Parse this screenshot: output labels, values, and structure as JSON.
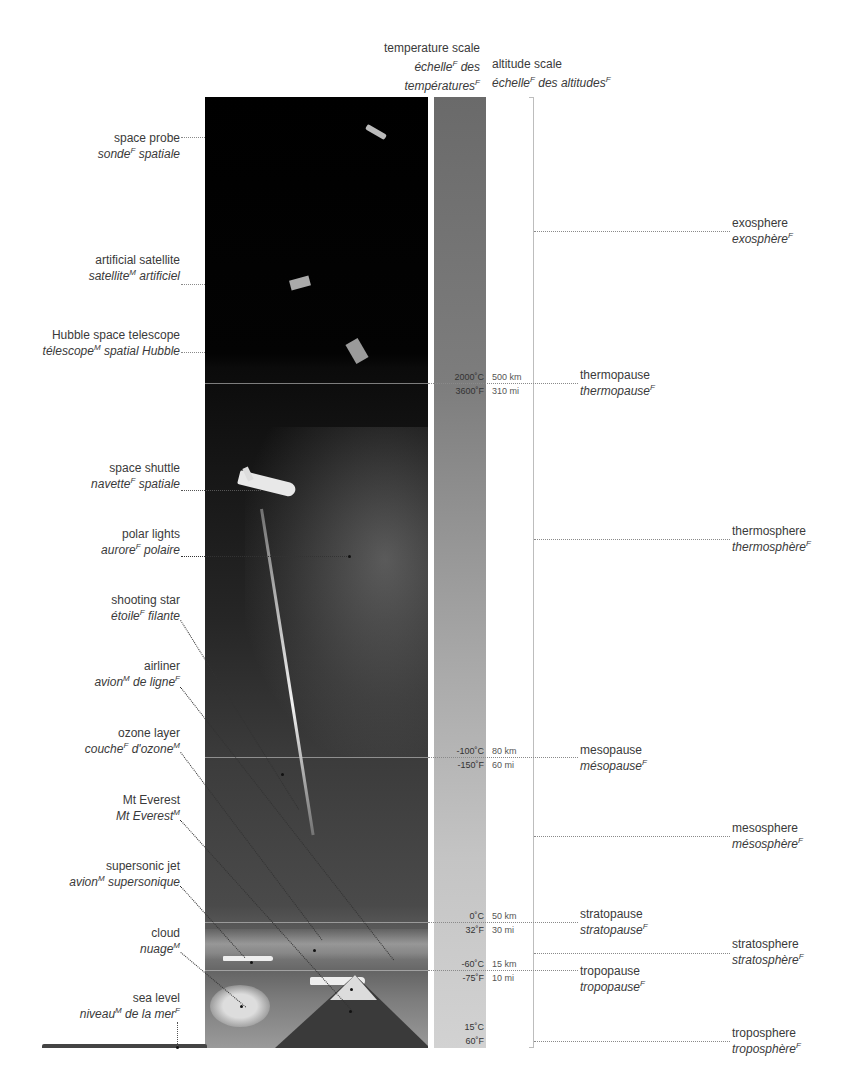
{
  "headers": {
    "temperature_scale": {
      "en": "temperature scale",
      "fr1": "échelle",
      "fr1_g": "F",
      "fr2": " des",
      "fr3": "températures",
      "fr3_g": "F"
    },
    "altitude_scale": {
      "en": "altitude scale",
      "fr1": "échelle",
      "fr1_g": "F",
      "fr2": " des altitudes",
      "fr2_g": "F"
    }
  },
  "left_labels": [
    {
      "en": "space probe",
      "fr": "sonde",
      "g": "F",
      "fr_rest": " spatiale"
    },
    {
      "en": "artificial satellite",
      "fr": "satellite",
      "g": "M",
      "fr_rest": " artificiel"
    },
    {
      "en": "Hubble space telescope",
      "fr": "télescope",
      "g": "M",
      "fr_rest": " spatial Hubble"
    },
    {
      "en": "space shuttle",
      "fr": "navette",
      "g": "F",
      "fr_rest": " spatiale"
    },
    {
      "en": "polar lights",
      "fr": "aurore",
      "g": "F",
      "fr_rest": " polaire"
    },
    {
      "en": "shooting star",
      "fr": "étoile",
      "g": "F",
      "fr_rest": " filante"
    },
    {
      "en": "airliner",
      "fr": "avion",
      "g": "M",
      "fr_rest": " de ligne",
      "g2": "F"
    },
    {
      "en": "ozone layer",
      "fr": "couche",
      "g": "F",
      "fr_rest": " d'ozone",
      "g2": "M"
    },
    {
      "en": "Mt Everest",
      "fr": "Mt Everest",
      "g": "M",
      "fr_rest": ""
    },
    {
      "en": "supersonic jet",
      "fr": "avion",
      "g": "M",
      "fr_rest": " supersonique"
    },
    {
      "en": "cloud",
      "fr": "nuage",
      "g": "M",
      "fr_rest": ""
    },
    {
      "en": "sea level",
      "fr": "niveau",
      "g": "M",
      "fr_rest": " de la mer",
      "g2": "F"
    }
  ],
  "boundaries": [
    {
      "en": "thermopause",
      "fr": "thermopause",
      "g": "F",
      "temp_c": "2000˚C",
      "temp_f": "3600˚F",
      "alt_km": "500 km",
      "alt_mi": "310 mi"
    },
    {
      "en": "mesopause",
      "fr": "mésopause",
      "g": "F",
      "temp_c": "-100˚C",
      "temp_f": "-150˚F",
      "alt_km": "80 km",
      "alt_mi": "60 mi"
    },
    {
      "en": "stratopause",
      "fr": "stratopause",
      "g": "F",
      "temp_c": "0˚C",
      "temp_f": "32˚F",
      "alt_km": "50 km",
      "alt_mi": "30 mi"
    },
    {
      "en": "tropopause",
      "fr": "tropopause",
      "g": "F",
      "temp_c": "-60˚C",
      "temp_f": "-75˚F",
      "alt_km": "15 km",
      "alt_mi": "10 mi"
    }
  ],
  "surface_temp": {
    "temp_c": "15˚C",
    "temp_f": "60˚F"
  },
  "layers": [
    {
      "en": "exosphere",
      "fr": "exosphère",
      "g": "F"
    },
    {
      "en": "thermosphere",
      "fr": "thermosphère",
      "g": "F"
    },
    {
      "en": "mesosphere",
      "fr": "mésosphère",
      "g": "F"
    },
    {
      "en": "stratosphere",
      "fr": "stratosphère",
      "g": "F"
    },
    {
      "en": "troposphere",
      "fr": "troposphère",
      "g": "F"
    }
  ]
}
